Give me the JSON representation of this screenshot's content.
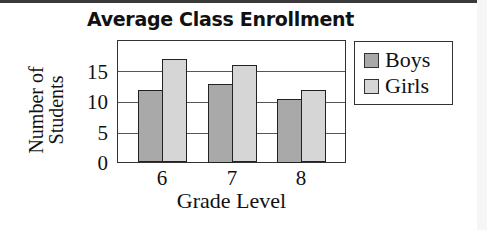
{
  "chart_data": {
    "type": "bar",
    "title": "Average Class Enrollment",
    "xlabel": "Grade Level",
    "ylabel": "Number of Students",
    "ylabel_lines": [
      "Number of",
      "Students"
    ],
    "categories": [
      "6",
      "7",
      "8"
    ],
    "series": [
      {
        "name": "Boys",
        "values": [
          11.5,
          12.5,
          10
        ],
        "color": "#a9a9a9"
      },
      {
        "name": "Girls",
        "values": [
          16.5,
          15.5,
          11.5
        ],
        "color": "#d6d6d6"
      }
    ],
    "yticks": [
      "0",
      "5",
      "10",
      "15"
    ],
    "ylim": [
      0,
      19.8
    ],
    "grid": true,
    "legend_position": "right"
  }
}
